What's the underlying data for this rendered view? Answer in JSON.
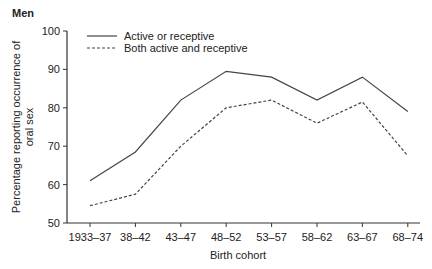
{
  "panel_title": "Men",
  "chart_data": {
    "type": "line",
    "title": "Men",
    "xlabel": "Birth cohort",
    "ylabel": "Percentage reporting occurrence of oral sex",
    "ylabel_lines": [
      "Percentage reporting occurrence of",
      "oral sex"
    ],
    "ylim": [
      50,
      100
    ],
    "yticks": [
      50,
      60,
      70,
      80,
      90,
      100
    ],
    "grid": false,
    "legend_position": "upper-left",
    "categories": [
      "1933–37",
      "38–42",
      "43–47",
      "48–52",
      "53–57",
      "58–62",
      "63–67",
      "68–74"
    ],
    "series": [
      {
        "name": "Active or receptive",
        "style": "solid",
        "color": "#444444",
        "values": [
          61,
          68.5,
          82,
          89.5,
          88,
          82,
          88,
          79
        ]
      },
      {
        "name": "Both active and receptive",
        "style": "dashed",
        "color": "#444444",
        "values": [
          54.5,
          57.5,
          70,
          80,
          82,
          76,
          81.5,
          67.5
        ]
      }
    ]
  }
}
